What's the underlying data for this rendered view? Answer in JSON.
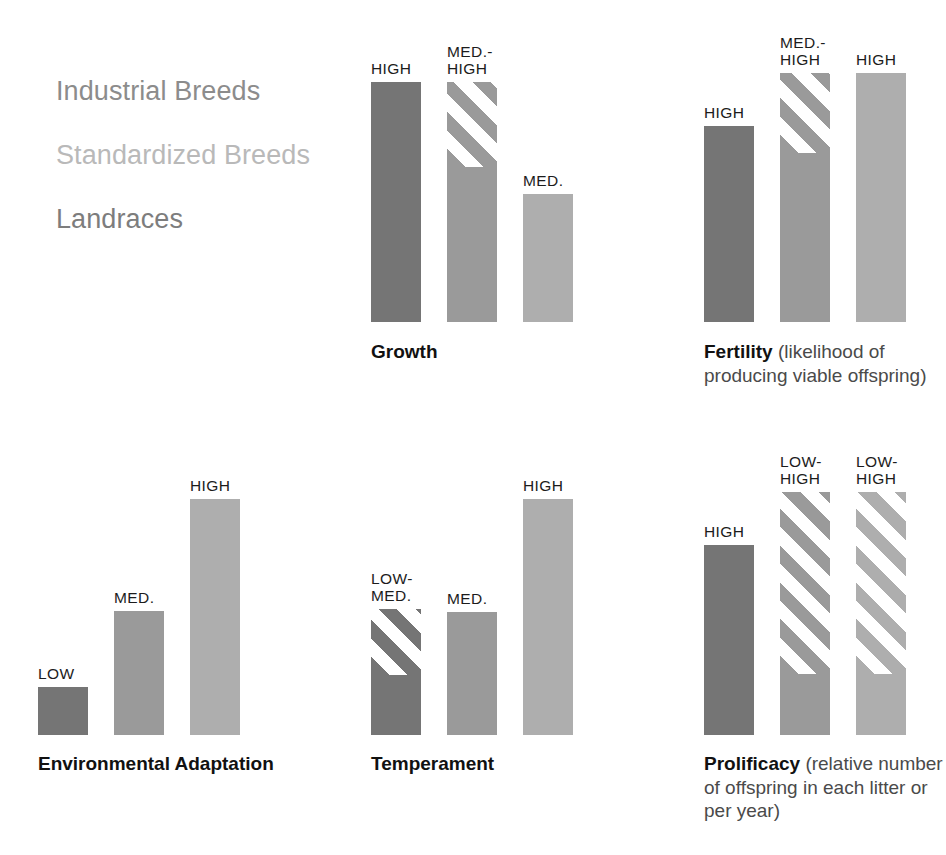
{
  "legend": {
    "items": [
      {
        "label": "Industrial Breeds",
        "color": "#8c8c8c",
        "series_color": "#757575"
      },
      {
        "label": "Standardized Breeds",
        "color": "#b9b9b9",
        "series_color": "#9a9a9a"
      },
      {
        "label": "Landraces",
        "color": "#7d7d7d",
        "series_color": "#aeaeae"
      }
    ]
  },
  "chart_data": {
    "type": "bar",
    "title": "",
    "xlabel": "",
    "ylabel": "",
    "scale_note": "Qualitative ordinal scale (LOW to HIGH); hatched bar segments indicate a range between the lower and upper rating.",
    "categories": [
      "Industrial Breeds",
      "Standardized Breeds",
      "Landraces"
    ],
    "rating_levels": [
      "LOW",
      "MED.",
      "HIGH"
    ],
    "groups": [
      {
        "name": "Growth",
        "title": "Growth",
        "subtitle": "",
        "bars": [
          {
            "series": "Industrial Breeds",
            "label": "HIGH",
            "rating_low": "HIGH",
            "rating_high": "HIGH",
            "solid": 240,
            "hatch": 0
          },
          {
            "series": "Standardized Breeds",
            "label": "MED.-\nHIGH",
            "rating_low": "MED.",
            "rating_high": "HIGH",
            "solid": 155,
            "hatch": 85
          },
          {
            "series": "Landraces",
            "label": "MED.",
            "rating_low": "MED.",
            "rating_high": "MED.",
            "solid": 128,
            "hatch": 0
          }
        ]
      },
      {
        "name": "Fertility",
        "title": "Fertility",
        "subtitle": " (likelihood of producing viable offspring)",
        "bars": [
          {
            "series": "Industrial Breeds",
            "label": "HIGH",
            "rating_low": "HIGH",
            "rating_high": "HIGH",
            "solid": 196,
            "hatch": 0
          },
          {
            "series": "Standardized Breeds",
            "label": "MED.-\nHIGH",
            "rating_low": "MED.",
            "rating_high": "HIGH",
            "solid": 169,
            "hatch": 80
          },
          {
            "series": "Landraces",
            "label": "HIGH",
            "rating_low": "HIGH",
            "rating_high": "HIGH",
            "solid": 249,
            "hatch": 0
          }
        ]
      },
      {
        "name": "Environmental Adaptation",
        "title": "Environmental Adaptation",
        "subtitle": "",
        "bars": [
          {
            "series": "Industrial Breeds",
            "label": "LOW",
            "rating_low": "LOW",
            "rating_high": "LOW",
            "solid": 48,
            "hatch": 0
          },
          {
            "series": "Standardized Breeds",
            "label": "MED.",
            "rating_low": "MED.",
            "rating_high": "MED.",
            "solid": 124,
            "hatch": 0
          },
          {
            "series": "Landraces",
            "label": "HIGH",
            "rating_low": "HIGH",
            "rating_high": "HIGH",
            "solid": 236,
            "hatch": 0
          }
        ]
      },
      {
        "name": "Temperament",
        "title": "Temperament",
        "subtitle": "",
        "bars": [
          {
            "series": "Industrial Breeds",
            "label": "LOW-\nMED.",
            "rating_low": "LOW",
            "rating_high": "MED.",
            "solid": 60,
            "hatch": 66
          },
          {
            "series": "Standardized Breeds",
            "label": "MED.",
            "rating_low": "MED.",
            "rating_high": "MED.",
            "solid": 123,
            "hatch": 0
          },
          {
            "series": "Landraces",
            "label": "HIGH",
            "rating_low": "HIGH",
            "rating_high": "HIGH",
            "solid": 236,
            "hatch": 0
          }
        ]
      },
      {
        "name": "Prolificacy",
        "title": "Prolificacy",
        "subtitle": " (relative number of offspring in each litter or per year)",
        "bars": [
          {
            "series": "Industrial Breeds",
            "label": "HIGH",
            "rating_low": "HIGH",
            "rating_high": "HIGH",
            "solid": 190,
            "hatch": 0
          },
          {
            "series": "Standardized Breeds",
            "label": "LOW-\nHIGH",
            "rating_low": "LOW",
            "rating_high": "HIGH",
            "solid": 61,
            "hatch": 182
          },
          {
            "series": "Landraces",
            "label": "LOW-\nHIGH",
            "rating_low": "LOW",
            "rating_high": "HIGH",
            "solid": 61,
            "hatch": 182
          }
        ]
      }
    ]
  }
}
